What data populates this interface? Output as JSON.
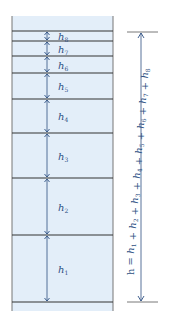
{
  "diagram": {
    "layers": [
      {
        "name": "h8",
        "label": "h",
        "sub": "8",
        "top": 31,
        "bottom": 41
      },
      {
        "name": "h7",
        "label": "h",
        "sub": "7",
        "top": 41,
        "bottom": 56
      },
      {
        "name": "h6",
        "label": "h",
        "sub": "6",
        "top": 56,
        "bottom": 73
      },
      {
        "name": "h5",
        "label": "h",
        "sub": "5",
        "top": 73,
        "bottom": 99
      },
      {
        "name": "h4",
        "label": "h",
        "sub": "4",
        "top": 99,
        "bottom": 133
      },
      {
        "name": "h3",
        "label": "h",
        "sub": "3",
        "top": 133,
        "bottom": 178
      },
      {
        "name": "h2",
        "label": "h",
        "sub": "2",
        "top": 178,
        "bottom": 235
      },
      {
        "name": "h1",
        "label": "h",
        "sub": "1",
        "top": 235,
        "bottom": 302
      }
    ],
    "total_formula": "h = h1 + h2 + h3 + h4 + h5 + h6 + h7 + h8",
    "colors": {
      "fill": "#e3eef9",
      "line": "#333333",
      "arrow": "#2d4f82"
    }
  }
}
